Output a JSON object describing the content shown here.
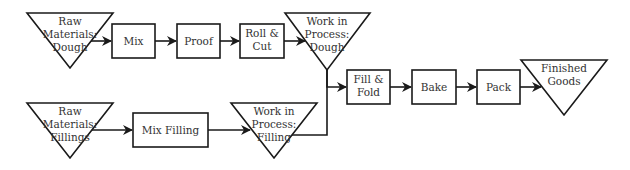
{
  "diagram": {
    "type": "process-flow",
    "nodes": {
      "raw_dough": {
        "shape": "inventory-triangle",
        "lines": [
          "Raw",
          "Materials:",
          "Dough"
        ]
      },
      "mix": {
        "shape": "process-box",
        "lines": [
          "Mix"
        ]
      },
      "proof": {
        "shape": "process-box",
        "lines": [
          "Proof"
        ]
      },
      "roll_cut": {
        "shape": "process-box",
        "lines": [
          "Roll &",
          "Cut"
        ]
      },
      "wip_dough": {
        "shape": "inventory-triangle",
        "lines": [
          "Work in",
          "Process:",
          "Dough"
        ]
      },
      "raw_fillings": {
        "shape": "inventory-triangle",
        "lines": [
          "Raw",
          "Materials:",
          "Fillings"
        ]
      },
      "mix_filling": {
        "shape": "process-box",
        "lines": [
          "Mix Filling"
        ]
      },
      "wip_filling": {
        "shape": "inventory-triangle",
        "lines": [
          "Work in",
          "Process:",
          "Filling"
        ]
      },
      "fill_fold": {
        "shape": "process-box",
        "lines": [
          "Fill &",
          "Fold"
        ]
      },
      "bake": {
        "shape": "process-box",
        "lines": [
          "Bake"
        ]
      },
      "pack": {
        "shape": "process-box",
        "lines": [
          "Pack"
        ]
      },
      "finished_goods": {
        "shape": "inventory-triangle",
        "lines": [
          "Finished",
          "Goods"
        ]
      }
    },
    "edges": [
      [
        "raw_dough",
        "mix"
      ],
      [
        "mix",
        "proof"
      ],
      [
        "proof",
        "roll_cut"
      ],
      [
        "roll_cut",
        "wip_dough"
      ],
      [
        "raw_fillings",
        "mix_filling"
      ],
      [
        "mix_filling",
        "wip_filling"
      ],
      [
        "wip_dough",
        "fill_fold"
      ],
      [
        "wip_filling",
        "fill_fold"
      ],
      [
        "fill_fold",
        "bake"
      ],
      [
        "bake",
        "pack"
      ],
      [
        "pack",
        "finished_goods"
      ]
    ],
    "colors": {
      "stroke": "#1a1a1a",
      "fill": "#ffffff",
      "text": "#333333"
    }
  }
}
